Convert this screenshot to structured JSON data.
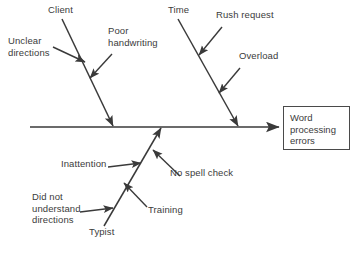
{
  "diagram": {
    "type": "fishbone-cause-and-effect",
    "effect": {
      "label": "Word\nprocessing\nerrors"
    },
    "spine": {
      "name": "main-spine-arrow",
      "x1": 30,
      "y1": 127,
      "x2": 279,
      "y2": 127
    },
    "branches": [
      {
        "id": "client",
        "label": "Client",
        "label_x": 48,
        "label_y": 9,
        "bone": {
          "x1": 62,
          "y1": 19,
          "x2": 113,
          "y2": 126
        },
        "causes": [
          {
            "id": "unclear-directions",
            "label": "Unclear\ndirections",
            "label_x": 8,
            "label_y": 40,
            "arrow": {
              "x1": 53,
              "y1": 47,
              "x2": 85,
              "y2": 62
            }
          },
          {
            "id": "poor-handwriting",
            "label": "Poor\nhandwriting",
            "label_x": 108,
            "label_y": 30,
            "arrow": {
              "x1": 112,
              "y1": 54,
              "x2": 90,
              "y2": 78
            }
          }
        ]
      },
      {
        "id": "time",
        "label": "Time",
        "label_x": 168,
        "label_y": 9,
        "bone": {
          "x1": 178,
          "y1": 19,
          "x2": 238,
          "y2": 126
        },
        "causes": [
          {
            "id": "rush-request",
            "label": "Rush request",
            "label_x": 216,
            "label_y": 14,
            "arrow": {
              "x1": 222,
              "y1": 27,
              "x2": 199,
              "y2": 55
            }
          },
          {
            "id": "overload",
            "label": "Overload",
            "label_x": 239,
            "label_y": 55,
            "arrow": {
              "x1": 240,
              "y1": 68,
              "x2": 219,
              "y2": 93
            }
          }
        ]
      },
      {
        "id": "typist",
        "label": "Typist",
        "label_x": 89,
        "label_y": 231,
        "bone": {
          "x1": 104,
          "y1": 226,
          "x2": 161,
          "y2": 128
        },
        "causes": [
          {
            "id": "inattention",
            "label": "Inattention",
            "label_x": 61,
            "label_y": 163,
            "arrow": {
              "x1": 108,
              "y1": 167,
              "x2": 141,
              "y2": 163
            }
          },
          {
            "id": "no-spell-check",
            "label": "No spell check",
            "label_x": 170,
            "label_y": 172,
            "arrow": {
              "x1": 180,
              "y1": 176,
              "x2": 153,
              "y2": 150
            }
          },
          {
            "id": "did-not-understand-directions",
            "label": "Did not\nunderstand\ndirections",
            "label_x": 32,
            "label_y": 196,
            "arrow": {
              "x1": 80,
              "y1": 212,
              "x2": 113,
              "y2": 208
            }
          },
          {
            "id": "training",
            "label": "Training",
            "label_x": 148,
            "label_y": 209,
            "arrow": {
              "x1": 147,
              "y1": 207,
              "x2": 124,
              "y2": 183
            }
          }
        ]
      }
    ],
    "colors": {
      "line": "#3a3a3a",
      "text": "#3b3b3b",
      "background": "#ffffff",
      "box_border": "#4a4a4a"
    }
  }
}
